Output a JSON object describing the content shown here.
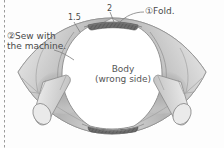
{
  "figure": {
    "kind": "sewing-instruction-diagram",
    "background_color": "#fdfdfd",
    "ink_color": "#4a4a4a"
  },
  "annotations": {
    "fold": {
      "marker": "①",
      "text": "Fold.",
      "full": "①Fold.",
      "leader": "curve from label left edge to dark folded band at top of body"
    },
    "sew": {
      "marker": "②",
      "line1": "②Sew with",
      "line2": "the machine.",
      "full": "②Sew with the machine.",
      "leader": "short line from text to upper-left seam of the wing panel"
    },
    "measure_left": {
      "value": "1.5",
      "leader": "tick line down-right to the left shoulder seam"
    },
    "measure_top": {
      "value": "2",
      "leader": "tick line down to the dark folded band"
    }
  },
  "body_piece": {
    "line1": "Body",
    "line2": "(wrong side)",
    "full": "Body (wrong side)",
    "fill_color": "#ffffff",
    "outline_color": "#8a8a8a"
  },
  "shapes": {
    "wing_panels": {
      "name": "shaded side panels",
      "fill_light": "#e9e9e9",
      "fill_mid": "#c8c8c8",
      "fill_dark": "#a9a9a9"
    },
    "fold_bands": {
      "name": "dark hatched folded edge bands (top and bottom)",
      "color": "#6f6f6f"
    },
    "straps": {
      "name": "cylindrical strap ends (left and right)",
      "count": 2,
      "fill": "#e2e2e2",
      "outline": "#8a8a8a"
    },
    "page_edge": {
      "name": "dashed page margin line at left",
      "color": "#9b9b9b",
      "style": "dashed vertical"
    }
  }
}
